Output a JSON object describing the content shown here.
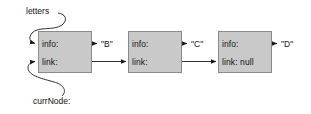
{
  "diagram": {
    "colors": {
      "node_fill": "#c9c9c9",
      "node_border": "#8a8a8a",
      "stroke": "#1a1a1a",
      "background": "#ffffff"
    },
    "pointers": [
      {
        "id": "letters",
        "label": "letters",
        "target": "node-1-info"
      },
      {
        "id": "currNode",
        "label": "currNode:",
        "target": "node-1-link"
      }
    ],
    "nodes": [
      {
        "id": "node-1",
        "info_label": "info:",
        "link_label": "link:",
        "value": "\"B\"",
        "link_is_null": false
      },
      {
        "id": "node-2",
        "info_label": "info:",
        "link_label": "link:",
        "value": "\"C\"",
        "link_is_null": false
      },
      {
        "id": "node-3",
        "info_label": "info:",
        "link_label": "link: null",
        "value": "\"D\"",
        "link_is_null": true
      }
    ]
  }
}
